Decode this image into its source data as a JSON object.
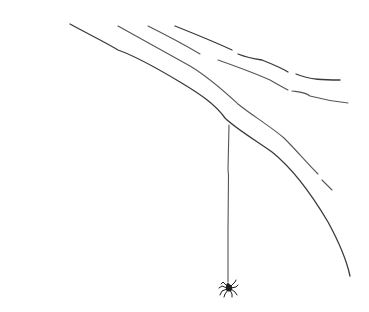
{
  "drawing": {
    "subject": "Spider hanging by a thread from a branch",
    "description": "Minimal pen line drawing on white background",
    "colors": {
      "background": "#ffffff",
      "ink": "#3a3a3a"
    },
    "elements": [
      "branch-lines",
      "silk-thread",
      "spider"
    ]
  }
}
